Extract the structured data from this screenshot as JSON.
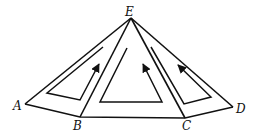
{
  "diagram": {
    "vertices": {
      "A": {
        "label": "A",
        "x": 25,
        "y": 104
      },
      "B": {
        "label": "B",
        "x": 80,
        "y": 117
      },
      "C": {
        "label": "C",
        "x": 185,
        "y": 118
      },
      "D": {
        "label": "D",
        "x": 233,
        "y": 107
      },
      "E": {
        "label": "E",
        "x": 131,
        "y": 18
      }
    },
    "labels": {
      "A": "A",
      "B": "B",
      "C": "C",
      "D": "D",
      "E": "E"
    },
    "faces": [
      {
        "name": "EAB",
        "arrow_direction": "up"
      },
      {
        "name": "EBC",
        "arrow_direction": "up-left"
      },
      {
        "name": "ECD",
        "arrow_direction": "up-left"
      }
    ],
    "color": "#111111"
  }
}
